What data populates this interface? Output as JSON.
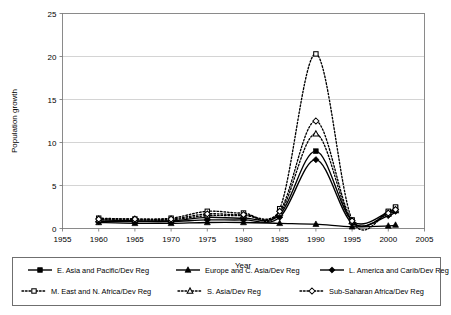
{
  "chart_data": {
    "type": "line",
    "title": "",
    "xlabel": "Year",
    "ylabel": "Population growth",
    "xlim": [
      1955,
      2005
    ],
    "ylim": [
      0,
      25
    ],
    "xticks": [
      1955,
      1960,
      1965,
      1970,
      1975,
      1980,
      1985,
      1990,
      1995,
      2000,
      2005
    ],
    "yticks": [
      0,
      5,
      10,
      15,
      20,
      25
    ],
    "grid": "horizontal",
    "legend_position": "bottom",
    "x": [
      1960,
      1965,
      1970,
      1975,
      1980,
      1985,
      1990,
      1995,
      2000,
      2001
    ],
    "series": [
      {
        "name": "E. Asia and Pacific/Dev Reg",
        "line": "solid",
        "marker": "square-filled",
        "values": [
          1.0,
          0.9,
          0.9,
          1.3,
          1.2,
          1.6,
          9.0,
          0.9,
          1.9,
          2.4
        ]
      },
      {
        "name": "Europe and C. Asia/Dev Reg",
        "line": "solid",
        "marker": "triangle-filled",
        "values": [
          0.7,
          0.6,
          0.6,
          0.7,
          0.7,
          0.6,
          0.5,
          0.2,
          0.3,
          0.4
        ]
      },
      {
        "name": "L. America and Carib/Dev Reg",
        "line": "solid",
        "marker": "diamond-filled",
        "values": [
          0.8,
          0.8,
          0.8,
          1.0,
          1.0,
          1.3,
          8.0,
          0.6,
          1.5,
          2.0
        ]
      },
      {
        "name": "M. East and N. Africa/Dev Reg",
        "line": "dotted",
        "marker": "square-open",
        "values": [
          1.2,
          1.1,
          1.2,
          2.0,
          1.8,
          2.3,
          20.3,
          1.0,
          2.0,
          2.5
        ]
      },
      {
        "name": "S. Asia/Dev Reg",
        "line": "dotted",
        "marker": "triangle-open",
        "values": [
          1.0,
          1.0,
          1.0,
          1.5,
          1.5,
          1.8,
          11.0,
          0.8,
          1.7,
          2.1
        ]
      },
      {
        "name": "Sub-Saharan Africa/Dev Reg",
        "line": "dotted",
        "marker": "diamond-open",
        "values": [
          1.1,
          1.1,
          1.1,
          1.7,
          1.6,
          2.0,
          12.5,
          0.9,
          1.8,
          2.2
        ]
      }
    ],
    "colors": {
      "line": "#000000",
      "grid": "#c9c9c9",
      "frame": "#8a8a8a",
      "background": "#ffffff"
    }
  },
  "legend": {
    "row1": [
      "E. Asia and Pacific/Dev Reg",
      "Europe and C. Asia/Dev Reg",
      "L. America and Carib/Dev Reg"
    ],
    "row2": [
      "M. East and N. Africa/Dev Reg",
      "S. Asia/Dev Reg",
      "Sub-Saharan Africa/Dev Reg"
    ]
  }
}
